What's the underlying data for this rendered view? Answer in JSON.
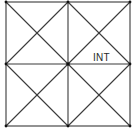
{
  "diagram": {
    "type": "square-grid-with-diagonals",
    "line_color": "#3a3a3a",
    "node_color": "#111111",
    "labels": [
      {
        "text": "INT",
        "x": 93,
        "y": 58
      }
    ],
    "corners": {
      "top_left": [
        6,
        2
      ],
      "top_right": [
        130,
        2
      ],
      "bottom_right": [
        130,
        126
      ],
      "bottom_left": [
        6,
        126
      ]
    },
    "center": [
      68,
      64
    ]
  }
}
